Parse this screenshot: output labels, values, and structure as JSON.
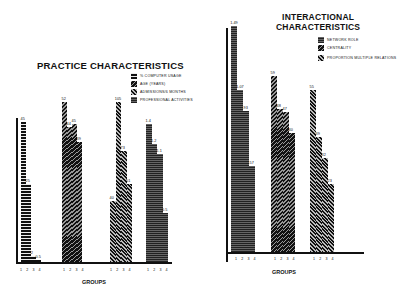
{
  "left": {
    "title": "PRACTICE CHARACTERISTICS",
    "legend": [
      {
        "label": "% COMPUTER USAGE",
        "pattern": "horizontal-bars"
      },
      {
        "label": "AGE (YEARS)",
        "pattern": "dense-diagonal"
      },
      {
        "label": "ADMISSIONS/6 MONTHS",
        "pattern": "diagonal-stripes"
      },
      {
        "label": "PROFESSIONAL ACTIVITIES",
        "pattern": "fine-horizontal"
      }
    ],
    "xlabel": "GROUPS",
    "ticks": "1 2 3 4"
  },
  "right": {
    "title_line1": "INTERACTIONAL",
    "title_line2": "CHARACTERISTICS",
    "legend": [
      {
        "label": "NETWORK ROLE",
        "pattern": "fine-horizontal"
      },
      {
        "label": "CENTRALITY",
        "pattern": "diagonal-stripes"
      },
      {
        "label": "PROPORTION MULTIPLE RELATIONS",
        "pattern": "dense-diagonal"
      }
    ],
    "xlabel": "GROUPS",
    "ticks": "1 2 3 4"
  },
  "chart_data": [
    {
      "type": "bar",
      "title": "PRACTICE CHARACTERISTICS",
      "xlabel": "GROUPS",
      "ylabel": "",
      "categories": [
        "1",
        "2",
        "3",
        "4"
      ],
      "series": [
        {
          "name": "% COMPUTER USAGE",
          "values": [
            45,
            25,
            2,
            0.5
          ],
          "labels": [
            "45",
            "25",
            "2",
            "0.5"
          ]
        },
        {
          "name": "AGE (YEARS)",
          "values": [
            52,
            44,
            45,
            39
          ],
          "labels": [
            "52",
            "44",
            "45",
            "39"
          ]
        },
        {
          "name": "ADMISSIONS/6 MONTHS",
          "values": [
            40,
            105,
            73,
            51
          ],
          "labels": [
            "40",
            "105",
            "73",
            "51"
          ]
        },
        {
          "name": "PROFESSIONAL ACTIVITIES",
          "values": [
            1.4,
            1.2,
            1.1,
            0.5
          ],
          "labels": [
            "1.4",
            "1.2",
            "1.1",
            "0.5"
          ]
        }
      ],
      "grid": false,
      "legend_position": "upper right"
    },
    {
      "type": "bar",
      "title": "INTERACTIONAL CHARACTERISTICS",
      "xlabel": "GROUPS",
      "ylabel": "",
      "categories": [
        "1",
        "2",
        "3",
        "4"
      ],
      "series": [
        {
          "name": "NETWORK ROLE",
          "values": [
            1.49,
            1.07,
            0.93,
            0.57
          ],
          "labels": [
            "1.49",
            "1.07",
            ".93",
            ".57"
          ]
        },
        {
          "name": "CENTRALITY",
          "values": [
            59,
            48,
            47,
            40
          ],
          "labels": [
            "59",
            "48",
            "47",
            "40"
          ]
        },
        {
          "name": "PROPORTION MULTIPLE RELATIONS",
          "values": [
            55,
            39,
            32,
            23
          ],
          "labels": [
            "55",
            "39",
            "32",
            "23"
          ]
        }
      ],
      "grid": false,
      "legend_position": "upper right"
    }
  ]
}
